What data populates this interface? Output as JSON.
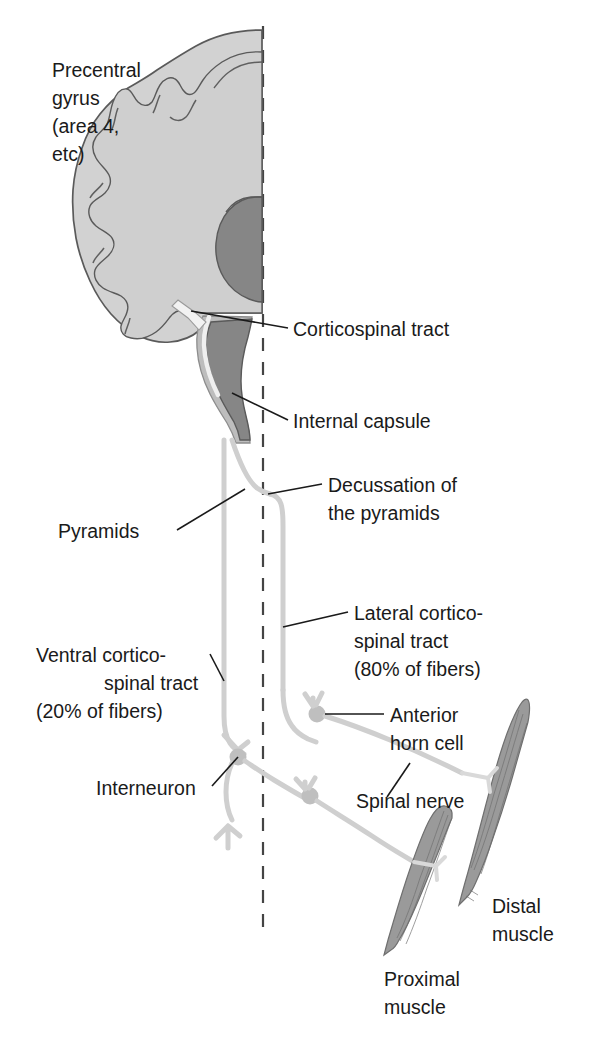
{
  "figure": {
    "background_color": "#ffffff",
    "midline_label": "midline-dashed-axis"
  },
  "labels": {
    "precentral_gyrus": {
      "line1": "Precentral",
      "line2": "gyrus",
      "line3": "(area 4,",
      "line4": "etc)"
    },
    "corticospinal_tract": "Corticospinal tract",
    "internal_capsule": "Internal capsule",
    "decussation": {
      "line1": "Decussation of",
      "line2": "the pyramids"
    },
    "pyramids": "Pyramids",
    "lateral_tract": {
      "line1": "Lateral cortico-",
      "line2": "spinal tract",
      "line3": "(80% of fibers)"
    },
    "ventral_tract": {
      "line1": "Ventral cortico-",
      "line2": "spinal tract",
      "line3": "(20% of fibers)"
    },
    "anterior_horn_cell": {
      "line1": "Anterior",
      "line2": "horn cell"
    },
    "interneuron": "Interneuron",
    "spinal_nerve": "Spinal nerve",
    "distal_muscle": {
      "line1": "Distal",
      "line2": "muscle"
    },
    "proximal_muscle": {
      "line1": "Proximal",
      "line2": "muscle"
    }
  },
  "values": {
    "lateral_fiber_percent": "80%",
    "ventral_fiber_percent": "20%",
    "brodmann_area": "area 4"
  },
  "colors": {
    "cortex_gray": "#d2d2d2",
    "internal_capsule_gray": "#868686",
    "tract_gray": "#cfcfcf",
    "muscle_gray": "#9a9a9a",
    "outline": "#5a5a5a",
    "text": "#1a1a1a",
    "midline": "#444444"
  }
}
